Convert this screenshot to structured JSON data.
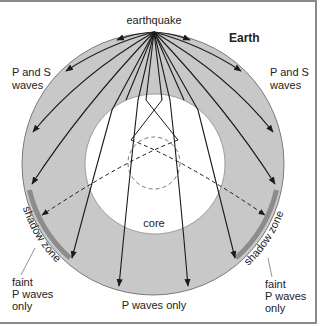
{
  "diagram": {
    "title": "Earth",
    "labels": {
      "earthquake": "earthquake",
      "ps_left_line1": "P and S",
      "ps_left_line2": "waves",
      "ps_right_line1": "P and S",
      "ps_right_line2": "waves",
      "core": "core",
      "shadow_left": "shadow zone",
      "shadow_right": "shadow zone",
      "faint_left_line1": "faint",
      "faint_left_line2": "P waves",
      "faint_left_line3": "only",
      "faint_right_line1": "faint",
      "faint_right_line2": "P waves",
      "faint_right_line3": "only",
      "p_only": "P waves only"
    },
    "colors": {
      "mantle": "#c8c8c8",
      "core": "#ffffff",
      "shadow_zone": "#8c8c8c",
      "ray": "#1a1a1a",
      "outline": "#7a7a7a"
    }
  }
}
